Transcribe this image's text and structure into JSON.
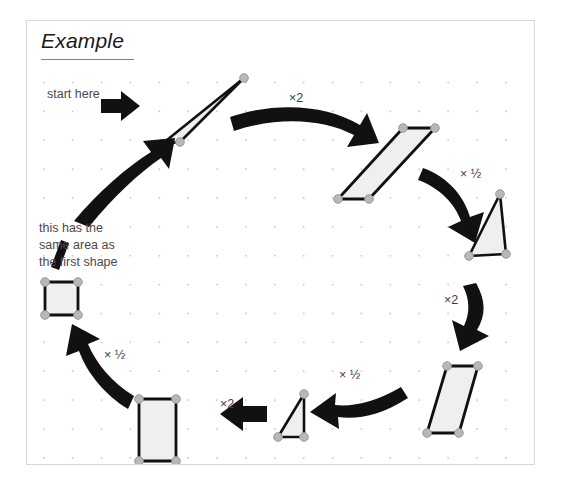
{
  "canvas": {
    "width": 563,
    "height": 488,
    "background_color": "#ffffff",
    "panel": {
      "x": 26,
      "y": 20,
      "width": 509,
      "height": 445,
      "border_color": "#d8d8d8",
      "fill_color": "#ffffff"
    },
    "grid": {
      "visible": true,
      "dot_color": "#c9c9c9",
      "spacing_px": 29,
      "origin_x": 16,
      "origin_y": 61
    }
  },
  "header": {
    "title": "Example",
    "title_style": "italic-underlined",
    "rule_color": "#808080"
  },
  "annotations": {
    "start_label": "start here",
    "area_note_lines": [
      "this has the",
      "same area as",
      "the first shape"
    ]
  },
  "colors": {
    "shape_fill": "#efefef",
    "shape_stroke": "#111111",
    "handle_fill": "#b8b8b8",
    "handle_stroke": "#8f8f8f",
    "arrow_fill": "#111111",
    "text_color": "#4a4a4a"
  },
  "flow": {
    "description": "A cycle of shapes transformed by alternating doubling and halving of area, returning to a shape with the same area as the start.",
    "steps": [
      {
        "index": 1,
        "shape": "thin-triangle",
        "operation_out": "×2"
      },
      {
        "index": 2,
        "shape": "slanted-parallelogram",
        "operation_out": "× ½"
      },
      {
        "index": 3,
        "shape": "right-triangle",
        "operation_out": "×2"
      },
      {
        "index": 4,
        "shape": "steep-parallelogram",
        "operation_out": "× ½"
      },
      {
        "index": 5,
        "shape": "small-right-triangle",
        "operation_out": "×2"
      },
      {
        "index": 6,
        "shape": "tall-rectangle",
        "operation_out": "× ½"
      },
      {
        "index": 7,
        "shape": "small-square",
        "operation_out": ""
      }
    ],
    "operation_labels": [
      {
        "id": "op-1",
        "text": "×2",
        "x": 288,
        "y": 98
      },
      {
        "id": "op-2",
        "text": "× ½",
        "x": 459,
        "y": 174
      },
      {
        "id": "op-3",
        "text": "×2",
        "x": 443,
        "y": 300
      },
      {
        "id": "op-4",
        "text": "× ½",
        "x": 338,
        "y": 375
      },
      {
        "id": "op-5",
        "text": "×2",
        "x": 219,
        "y": 404
      },
      {
        "id": "op-6",
        "text": "× ½",
        "x": 103,
        "y": 355
      }
    ]
  }
}
